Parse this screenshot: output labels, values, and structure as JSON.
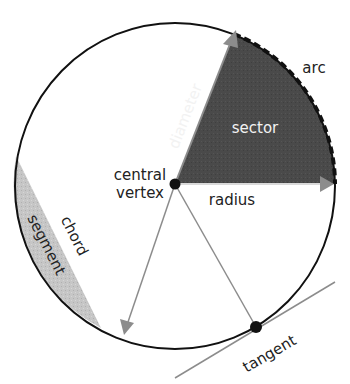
{
  "diagram": {
    "labels": {
      "diameter": "diameter",
      "sector": "sector",
      "arc": "arc",
      "central_vertex_line1": "central",
      "central_vertex_line2": "vertex",
      "radius": "radius",
      "chord": "chord",
      "segment": "segment",
      "tangent": "tangent"
    },
    "colors": {
      "circle_stroke": "#111111",
      "sector_fill": "#4a4a4a",
      "segment_fill": "#c4c4c4",
      "arrow_gray": "#8c8c8c",
      "dot": "#111111",
      "background": "#ffffff"
    }
  }
}
